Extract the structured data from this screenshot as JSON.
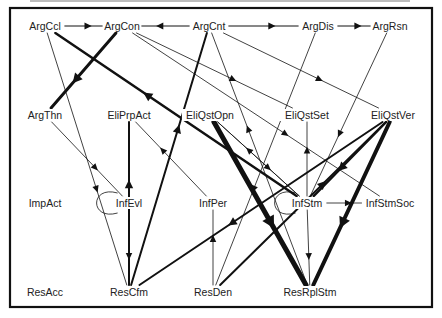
{
  "diagram": {
    "frame": {
      "x": 10,
      "y": 8,
      "w": 422,
      "h": 299
    },
    "nodes": [
      {
        "id": "ArgCcl",
        "label": "ArgCcl",
        "x": 45,
        "y": 26
      },
      {
        "id": "ArgCon",
        "label": "ArgCon",
        "x": 122,
        "y": 26
      },
      {
        "id": "ArgCnt",
        "label": "ArgCnt",
        "x": 209,
        "y": 26
      },
      {
        "id": "ArgDis",
        "label": "ArgDis",
        "x": 318,
        "y": 26
      },
      {
        "id": "ArgRsn",
        "label": "ArgRsn",
        "x": 390,
        "y": 26
      },
      {
        "id": "ArgThn",
        "label": "ArgThn",
        "x": 45,
        "y": 115
      },
      {
        "id": "EliPrpAct",
        "label": "EliPrpAct",
        "x": 129,
        "y": 115
      },
      {
        "id": "EliQstOpn",
        "label": "EliQstOpn",
        "x": 210,
        "y": 115
      },
      {
        "id": "EliQstSet",
        "label": "EliQstSet",
        "x": 307,
        "y": 115
      },
      {
        "id": "EliQstVer",
        "label": "EliQstVer",
        "x": 393,
        "y": 115
      },
      {
        "id": "ImpAct",
        "label": "ImpAct",
        "x": 45,
        "y": 203
      },
      {
        "id": "InfEvl",
        "label": "InfEvl",
        "x": 129,
        "y": 203
      },
      {
        "id": "InfPer",
        "label": "InfPer",
        "x": 213,
        "y": 203
      },
      {
        "id": "InfStm",
        "label": "InfStm",
        "x": 307,
        "y": 203
      },
      {
        "id": "InfStmSoc",
        "label": "InfStmSoc",
        "x": 390,
        "y": 203
      },
      {
        "id": "ResAcc",
        "label": "ResAcc",
        "x": 45,
        "y": 292
      },
      {
        "id": "ResCfm",
        "label": "ResCfm",
        "x": 129,
        "y": 292
      },
      {
        "id": "ResDen",
        "label": "ResDen",
        "x": 213,
        "y": 292
      },
      {
        "id": "ResRplStm",
        "label": "ResRplStm",
        "x": 310,
        "y": 292
      }
    ],
    "edges": [
      {
        "from": "ArgCcl",
        "to": "ArgCon",
        "w": 1
      },
      {
        "from": "ArgCnt",
        "to": "ArgCon",
        "w": 1
      },
      {
        "from": "ArgDis",
        "to": "ArgRsn",
        "w": 1
      },
      {
        "from": "ArgCnt",
        "to": "ArgDis",
        "w": 1
      },
      {
        "from": "ArgCon",
        "to": "ArgThn",
        "w": 3
      },
      {
        "from": "InfStm",
        "to": "ArgCcl",
        "w": 2.5
      },
      {
        "from": "ArgCcl",
        "to": "ResCfm",
        "w": 0.8
      },
      {
        "from": "ArgThn",
        "to": "InfEvl",
        "w": 0.8
      },
      {
        "from": "ArgCon",
        "to": "EliQstSet",
        "w": 0.8
      },
      {
        "from": "ArgCon",
        "to": "InfStmSoc",
        "w": 0.8
      },
      {
        "from": "ArgCnt",
        "to": "EliQstVer",
        "w": 0.8
      },
      {
        "from": "ResRplStm",
        "to": "ArgCnt",
        "w": 0.8
      },
      {
        "from": "ResCfm",
        "to": "ArgCnt",
        "w": 2
      },
      {
        "from": "ArgDis",
        "to": "ResDen",
        "w": 0.8
      },
      {
        "from": "ArgRsn",
        "to": "InfStm",
        "w": 0.8
      },
      {
        "from": "ResCfm",
        "to": "EliPrpAct",
        "w": 2
      },
      {
        "from": "EliPrpAct",
        "to": "ResCfm",
        "w": 0.01
      },
      {
        "from": "InfPer",
        "to": "EliPrpAct",
        "w": 0.8
      },
      {
        "from": "InfStm",
        "to": "EliQstOpn",
        "w": 0.8
      },
      {
        "from": "EliQstOpn",
        "to": "ResRplStm",
        "w": 5
      },
      {
        "from": "EliQstOpn",
        "to": "InfStm",
        "w": 0.8
      },
      {
        "from": "InfStm",
        "to": "EliQstSet",
        "w": 0.8
      },
      {
        "from": "EliQstVer",
        "to": "ResRplStm",
        "w": 4
      },
      {
        "from": "EliQstVer",
        "to": "InfStm",
        "w": 2.5
      },
      {
        "from": "EliQstVer",
        "to": "ResCfm",
        "w": 2
      },
      {
        "from": "ResDen",
        "to": "EliQstVer",
        "w": 2
      },
      {
        "from": "InfStm",
        "to": "InfStmSoc",
        "w": 0.8
      },
      {
        "from": "InfStm",
        "to": "ResRplStm",
        "w": 0.8
      },
      {
        "from": "ResDen",
        "to": "InfPer",
        "w": 0.8
      },
      {
        "from": "InfEvl",
        "to": "ResCfm",
        "w": 0.8
      }
    ],
    "self_loops": [
      {
        "node": "InfEvl",
        "w": 0.8
      },
      {
        "node": "InfStm",
        "w": 0.8
      }
    ]
  }
}
